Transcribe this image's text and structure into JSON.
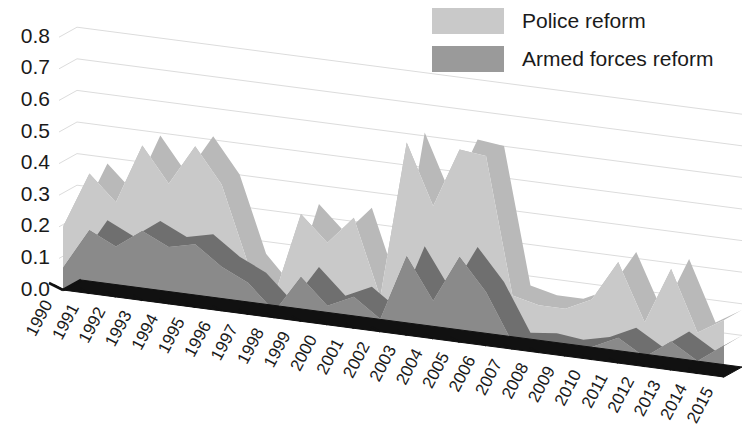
{
  "chart_data": {
    "type": "area",
    "stacked": true,
    "three_d": true,
    "title": "",
    "subtitle": "",
    "xlabel": "",
    "ylabel": "",
    "ylim": [
      0.0,
      0.8
    ],
    "ytick_labels": [
      "0.8",
      "0.7",
      "0.6",
      "0.5",
      "0.4",
      "0.3",
      "0.2",
      "0.1",
      "0.0"
    ],
    "ytick_values": [
      0.8,
      0.7,
      0.6,
      0.5,
      0.4,
      0.3,
      0.2,
      0.1,
      0.0
    ],
    "grid": true,
    "legend_position": "top-right",
    "categories": [
      "1990",
      "1991",
      "1992",
      "1993",
      "1994",
      "1995",
      "1996",
      "1997",
      "1998",
      "1999",
      "2000",
      "2001",
      "2002",
      "2003",
      "2004",
      "2005",
      "2006",
      "2007",
      "2008",
      "2009",
      "2010",
      "2011",
      "2012",
      "2013",
      "2014",
      "2015"
    ],
    "series": [
      {
        "name": "Armed forces reform",
        "color": "#8a8a8a",
        "values": [
          0.07,
          0.2,
          0.16,
          0.22,
          0.18,
          0.2,
          0.14,
          0.1,
          0.02,
          0.14,
          0.06,
          0.1,
          0.04,
          0.25,
          0.12,
          0.27,
          0.17,
          0.02,
          0.03,
          0.02,
          0.04,
          0.08,
          0.03,
          0.09,
          0.04,
          0.1
        ]
      },
      {
        "name": "Police reform",
        "color": "#c9c9c9",
        "values": [
          0.13,
          0.18,
          0.14,
          0.27,
          0.2,
          0.31,
          0.26,
          0.06,
          0.05,
          0.2,
          0.2,
          0.25,
          0.07,
          0.36,
          0.3,
          0.34,
          0.43,
          0.15,
          0.12,
          0.13,
          0.15,
          0.24,
          0.11,
          0.23,
          0.09,
          0.08
        ]
      }
    ],
    "totals": [
      0.2,
      0.38,
      0.3,
      0.49,
      0.38,
      0.51,
      0.4,
      0.16,
      0.07,
      0.34,
      0.26,
      0.35,
      0.11,
      0.61,
      0.42,
      0.61,
      0.6,
      0.17,
      0.15,
      0.15,
      0.19,
      0.32,
      0.14,
      0.32,
      0.13,
      0.18
    ]
  },
  "legend": {
    "items": [
      {
        "label": "Police reform",
        "color": "#c9c9c9"
      },
      {
        "label": "Armed forces reform",
        "color": "#9a9a9a"
      }
    ]
  }
}
